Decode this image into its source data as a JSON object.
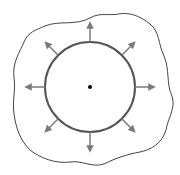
{
  "diagram": {
    "type": "radial-expansion",
    "center": {
      "x": 90,
      "y": 87
    },
    "circle": {
      "radius": 45,
      "stroke": "#555555",
      "stroke_width": 2
    },
    "center_dot": {
      "radius": 2,
      "fill": "#000000"
    },
    "arrows": {
      "count": 8,
      "length": 16,
      "color": "#7a7a7a",
      "directions_deg": [
        0,
        45,
        90,
        135,
        180,
        225,
        270,
        315
      ]
    },
    "outer_boundary": {
      "stroke": "#444444",
      "stroke_width": 1,
      "shape": "wavy-closed-curve"
    }
  }
}
